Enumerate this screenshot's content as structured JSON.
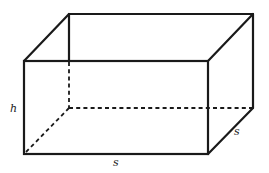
{
  "diagram": {
    "type": "rectangular-prism",
    "labels": {
      "height": "h",
      "front_width": "s",
      "depth": "s"
    },
    "colors": {
      "stroke": "#1a1a1a",
      "background": "#ffffff"
    }
  }
}
